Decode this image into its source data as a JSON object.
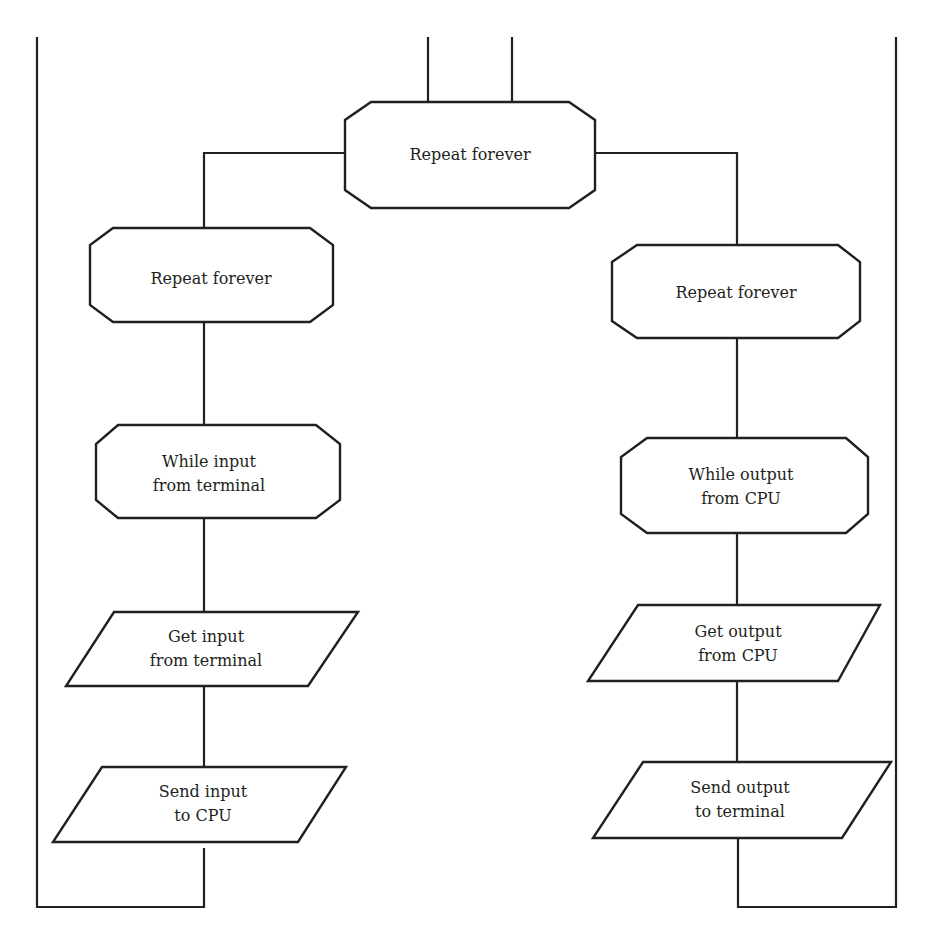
{
  "diagram": {
    "type": "flowchart",
    "colors": {
      "stroke": "#231f20",
      "fill": "#ffffff",
      "text": "#231f20"
    },
    "nodes": {
      "root": {
        "shape": "octagon",
        "lines": [
          "Repeat forever"
        ]
      },
      "left_loop": {
        "shape": "octagon",
        "lines": [
          "Repeat forever"
        ]
      },
      "left_while": {
        "shape": "octagon",
        "lines": [
          "While input",
          "from terminal"
        ]
      },
      "left_get": {
        "shape": "parallelogram",
        "lines": [
          "Get input",
          "from terminal"
        ]
      },
      "left_send": {
        "shape": "parallelogram",
        "lines": [
          "Send input",
          "to CPU"
        ]
      },
      "right_loop": {
        "shape": "octagon",
        "lines": [
          "Repeat forever"
        ]
      },
      "right_while": {
        "shape": "octagon",
        "lines": [
          "While output",
          "from CPU"
        ]
      },
      "right_get": {
        "shape": "parallelogram",
        "lines": [
          "Get output",
          "from CPU"
        ]
      },
      "right_send": {
        "shape": "parallelogram",
        "lines": [
          "Send output",
          "to terminal"
        ]
      }
    },
    "edges": [
      [
        "root",
        "left_loop"
      ],
      [
        "root",
        "right_loop"
      ],
      [
        "left_loop",
        "left_while"
      ],
      [
        "left_while",
        "left_get"
      ],
      [
        "left_get",
        "left_send"
      ],
      [
        "right_loop",
        "right_while"
      ],
      [
        "right_while",
        "right_get"
      ],
      [
        "right_get",
        "right_send"
      ]
    ]
  }
}
